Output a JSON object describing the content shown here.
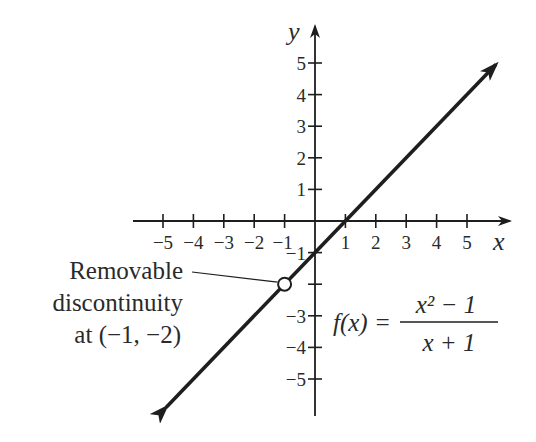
{
  "chart_data": {
    "type": "line",
    "title": "",
    "function_label": "f(x) = (x^2 - 1)/(x + 1)",
    "formula": {
      "lhs": "f(x) =",
      "numerator": "x² − 1",
      "denominator": "x + 1"
    },
    "xlabel": "x",
    "ylabel": "y",
    "xlim": [
      -5,
      5
    ],
    "ylim": [
      -5,
      5
    ],
    "grid": false,
    "x_ticks": [
      "−5",
      "−4",
      "−3",
      "−2",
      "−1",
      "1",
      "2",
      "3",
      "4",
      "5"
    ],
    "y_ticks": [
      "5",
      "4",
      "3",
      "2",
      "1",
      "−1",
      "−2",
      "−3",
      "−4",
      "−5"
    ],
    "series": [
      {
        "name": "f(x) = x − 1 (x ≠ −1)",
        "x": [
          -5,
          -4,
          -3,
          -2,
          -1,
          0,
          1,
          2,
          3,
          4,
          5
        ],
        "y": [
          -6,
          -5,
          -4,
          -3,
          -2,
          -1,
          0,
          1,
          2,
          3,
          4
        ],
        "arrows_both_ends": true
      }
    ],
    "open_point": {
      "x": -1,
      "y": -2
    },
    "annotation": {
      "lines": [
        "Removable",
        "discontinuity",
        "at (−1, −2)"
      ],
      "target": {
        "x": -1,
        "y": -2
      }
    }
  },
  "colors": {
    "ink": "#1e1e1e",
    "background": "#ffffff"
  }
}
